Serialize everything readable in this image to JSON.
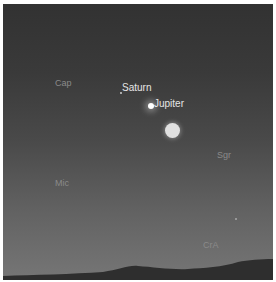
{
  "scene": {
    "description": "Evening sky view above horizon",
    "planets": [
      {
        "name": "Saturn"
      },
      {
        "name": "Jupiter"
      }
    ],
    "constellations": [
      {
        "abbr": "Cap"
      },
      {
        "abbr": "Sgr"
      },
      {
        "abbr": "Mic"
      },
      {
        "abbr": "CrA"
      }
    ],
    "objects": [
      "moon"
    ],
    "colors": {
      "sky_top": "#323232",
      "sky_bottom": "#767676",
      "ground": "#2e2e2e",
      "planet_label": "#e6e6e6",
      "constellation_label": "#8a8a8a"
    }
  }
}
